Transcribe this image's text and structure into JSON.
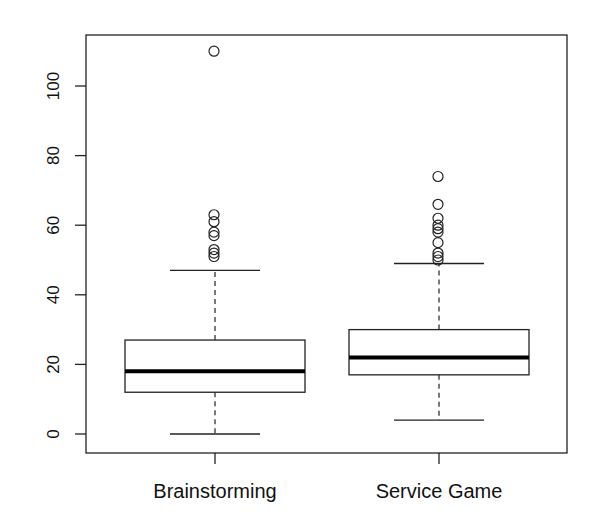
{
  "chart_data": {
    "type": "boxplot",
    "title": "",
    "xlabel": "",
    "ylabel": "",
    "ylim": [
      -4,
      114
    ],
    "yticks": [
      0,
      20,
      40,
      60,
      80,
      100
    ],
    "categories": [
      "Brainstorming",
      "Service Game"
    ],
    "series": [
      {
        "name": "Brainstorming",
        "whisker_low": 0,
        "q1": 12,
        "median": 18,
        "q3": 27,
        "whisker_high": 47,
        "outliers": [
          110,
          63,
          61,
          58,
          57,
          53,
          52,
          51
        ]
      },
      {
        "name": "Service Game",
        "whisker_low": 4,
        "q1": 17,
        "median": 22,
        "q3": 30,
        "whisker_high": 49,
        "outliers": [
          74,
          66,
          62,
          60,
          59,
          58,
          55,
          52,
          51,
          50
        ]
      }
    ],
    "grid": false,
    "legend": null
  },
  "colors": {
    "line": "#222222",
    "background": "#ffffff"
  }
}
